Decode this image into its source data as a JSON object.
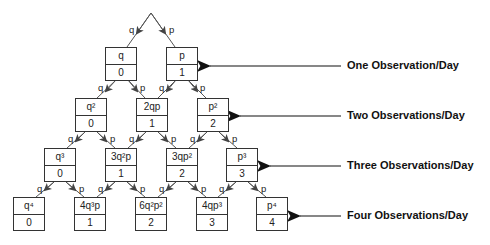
{
  "tree": {
    "rows": [
      {
        "nodes": [
          {
            "prob": "q",
            "value": "0"
          },
          {
            "prob": "p",
            "value": "1"
          }
        ]
      },
      {
        "nodes": [
          {
            "prob": "q²",
            "value": "0"
          },
          {
            "prob": "2qp",
            "value": "1"
          },
          {
            "prob": "p²",
            "value": "2"
          }
        ]
      },
      {
        "nodes": [
          {
            "prob": "q³",
            "value": "0"
          },
          {
            "prob": "3q²p",
            "value": "1"
          },
          {
            "prob": "3qp²",
            "value": "2"
          },
          {
            "prob": "p³",
            "value": "3"
          }
        ]
      },
      {
        "nodes": [
          {
            "prob": "q⁴",
            "value": "0"
          },
          {
            "prob": "4q³p",
            "value": "1"
          },
          {
            "prob": "6q²p²",
            "value": "2"
          },
          {
            "prob": "4qp³",
            "value": "3"
          },
          {
            "prob": "p⁴",
            "value": "4"
          }
        ]
      }
    ],
    "branch_labels": {
      "left": "q",
      "right": "p"
    }
  },
  "annotations": [
    {
      "label": "One Observation/Day"
    },
    {
      "label": "Two Observations/Day"
    },
    {
      "label": "Three Observations/Day"
    },
    {
      "label": "Four Observations/Day"
    }
  ]
}
